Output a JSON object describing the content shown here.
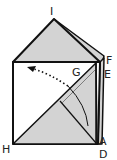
{
  "diagram": {
    "type": "origami-fold-step",
    "labels": {
      "I": "I",
      "F": "F",
      "E": "E",
      "G": "G",
      "H": "H",
      "A": "A",
      "D": "D"
    },
    "colors": {
      "fill": "#d3d3d3",
      "stroke": "#111111",
      "background": "#ffffff"
    },
    "annotations": {
      "fold_arrow": "dotted arrow with curved fold path from D toward upper-left"
    }
  }
}
